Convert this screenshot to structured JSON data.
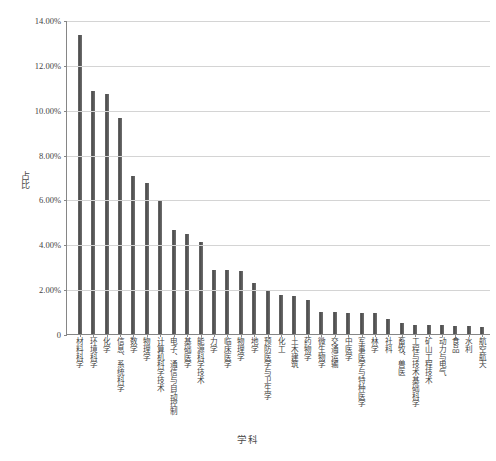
{
  "chart_data": {
    "type": "bar",
    "title": "",
    "xlabel": "学科",
    "ylabel": "占比",
    "ylim": [
      0,
      0.14
    ],
    "ytick_labels": [
      "0",
      "2.00%",
      "4.00%",
      "6.00%",
      "8.00%",
      "10.00%",
      "12.00%",
      "14.00%"
    ],
    "ytick_values": [
      0,
      0.02,
      0.04,
      0.06,
      0.08,
      0.1,
      0.12,
      0.14
    ],
    "grid": true,
    "legend": null,
    "bar_color": "#595959",
    "categories": [
      "材料科学",
      "环境科学",
      "化学",
      "信息、系统科学",
      "数学",
      "物理学",
      "计算机科学技术",
      "电子、通信与自动控制",
      "基础医学",
      "能源科学技术",
      "力学",
      "临床医学",
      "物理学",
      "地学",
      "预防医学与卫生学",
      "化工",
      "土木建筑",
      "药物学",
      "微生物学",
      "交通运输",
      "中医学",
      "军事医学与特种医学",
      "林学",
      "社科",
      "畜牧、兽医",
      "工程与技术基础科学",
      "矿山工程技术",
      "动力与电气",
      "食品",
      "水利",
      "航空航天"
    ],
    "values": [
      0.1332,
      0.1085,
      0.1072,
      0.0964,
      0.0705,
      0.0673,
      0.0596,
      0.0462,
      0.0444,
      0.0411,
      0.0286,
      0.0286,
      0.028,
      0.0228,
      0.0196,
      0.0174,
      0.0168,
      0.0152,
      0.0098,
      0.0096,
      0.0094,
      0.0093,
      0.0092,
      0.0066,
      0.0048,
      0.0042,
      0.004,
      0.0038,
      0.0036,
      0.0034,
      0.003
    ],
    "value_labels": [
      "13.32%",
      "10.85%",
      "10.72%",
      "9.64%",
      "7.05%",
      "6.73%",
      "5.96%",
      "4.62%",
      "4.44%",
      "4.11%",
      "2.86%",
      "2.86%",
      "2.80%",
      "2.28%",
      "1.96%",
      "1.74%",
      "1.68%",
      "1.52%",
      "0.98%",
      "0.96%",
      "0.94%",
      "0.93%",
      "0.92%",
      "0.66%",
      "0.48%",
      "0.42%",
      "0.40%",
      "0.38%",
      "0.36%",
      "0.34%",
      "0.30%"
    ]
  },
  "axes": {
    "y_title": "占比",
    "x_title": "学科"
  }
}
